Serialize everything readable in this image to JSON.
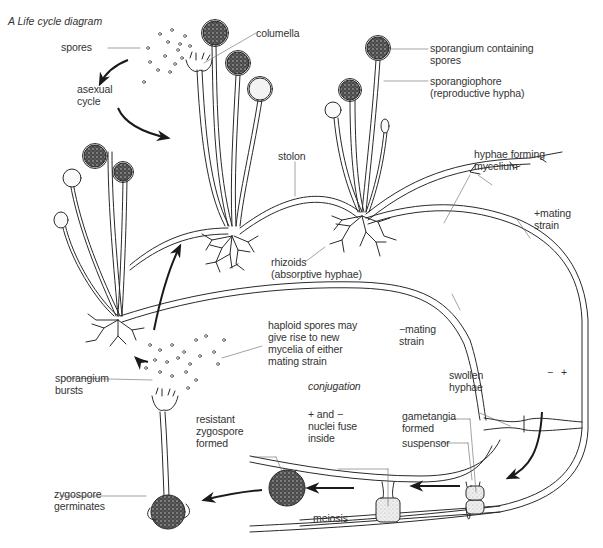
{
  "diagram": {
    "title": "A  Life cycle diagram",
    "sections": {
      "asexual": "asexual cycle",
      "sexual": "conjugation"
    },
    "labels": {
      "spores": "spores",
      "asexual_cycle": "asexual\ncycle",
      "columella": "columella",
      "sporangium_containing_spores": "sporangium containing\nspores",
      "sporangiophore": "sporangiophore\n(reproductive hypha)",
      "hyphae_forming_mycelium": "hyphae forming\nmycelium",
      "stolon": "stolon",
      "plus_mating_strain": "+mating\nstrain",
      "rhizoids": "rhizoids\n(absorptive hyphae)",
      "haploid_spores": "haploid spores may\ngive rise to new\nmycelia of either\nmating strain",
      "minus_mating_strain": "−mating\nstrain",
      "sporangium_bursts": "sporangium\nbursts",
      "conjugation": "conjugation",
      "swollen_hyphae": "swollen\nhyphae",
      "minus_sign": "−",
      "plus_sign": "+",
      "nuclei_fuse": "+ and −\nnuclei fuse\ninside",
      "gametangia_formed": "gametangia\nformed",
      "suspensor": "suspensor",
      "resistant_zygospore": "resistant\nzygospore\nformed",
      "zygospore_germinates": "zygospore\ngerminates",
      "meiosis": "meiosis"
    },
    "colors": {
      "line": "#2a2a2a",
      "leader": "#555555",
      "spore_dark": "#2b2b2b",
      "fill_light": "#e6e6e6"
    }
  }
}
